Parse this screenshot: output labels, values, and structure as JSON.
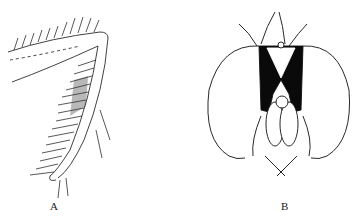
{
  "figure": {
    "panels": [
      {
        "label": "A",
        "subject": "hairy insect leg (femur and tibia)"
      },
      {
        "label": "B",
        "subject": "fly head, frontal view"
      }
    ],
    "colors": {
      "line": "#111111",
      "background": "#ffffff",
      "fill": "#0a0a0a"
    }
  }
}
